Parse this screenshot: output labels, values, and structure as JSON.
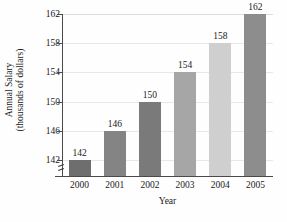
{
  "chart_data": {
    "type": "bar",
    "title": "",
    "categories": [
      "2000",
      "2001",
      "2002",
      "2003",
      "2004",
      "2005"
    ],
    "values": [
      142,
      146,
      150,
      154,
      158,
      162
    ],
    "data_labels": [
      "142",
      "146",
      "150",
      "154",
      "158",
      "162"
    ],
    "xlabel": "Year",
    "ylabel_line1": "Annual Salary",
    "ylabel_line2": "(thousands of dollars)",
    "ylabel": "Annual Salary (thousands of dollars)",
    "ytick_labels": [
      "142",
      "146",
      "150",
      "154",
      "158",
      "162"
    ],
    "ytick_values": [
      142,
      146,
      150,
      154,
      158,
      162
    ],
    "ylim": [
      140,
      162
    ],
    "axis_break": true,
    "grid": true,
    "grid_axis": "y",
    "legend": "none",
    "bar_colors": [
      "#6e6e6e",
      "#848484",
      "#7a7a7a",
      "#a6a6a6",
      "#cfcfcf",
      "#8d8d8d"
    ],
    "units": "thousands of dollars",
    "background_color": "#fefefe",
    "axis_color": "#4a4a4a",
    "gridline_color": "#e8e8e8",
    "text_color": "#1a1a1a"
  }
}
